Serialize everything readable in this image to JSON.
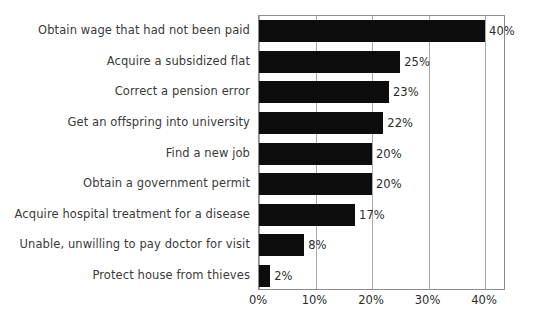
{
  "chart_data": {
    "type": "bar",
    "orientation": "horizontal",
    "title": "",
    "subtitle": "",
    "xlabel": "",
    "ylabel": "",
    "xlim": [
      0,
      43.7
    ],
    "grid": true,
    "legend": null,
    "categories": [
      "Obtain wage that had not been paid",
      "Acquire a subsidized flat",
      "Correct a pension error",
      "Get an offspring into university",
      "Find a new job",
      "Obtain a government permit",
      "Acquire hospital treatment for a disease",
      "Unable, unwilling to pay doctor for visit",
      "Protect house from thieves"
    ],
    "values": [
      40,
      25,
      23,
      22,
      20,
      20,
      17,
      8,
      2
    ],
    "value_labels": [
      "40%",
      "25%",
      "23%",
      "22%",
      "20%",
      "20%",
      "17%",
      "8%",
      "2%"
    ],
    "xticks": [
      0,
      10,
      20,
      30,
      40
    ],
    "xtick_labels": [
      "0%",
      "10%",
      "20%",
      "30%",
      "40%"
    ],
    "bar_color": "#0d0d0d",
    "grid_color": "#a8a8a8",
    "border_color": "#8c8c8c",
    "background_color": "#ffffff",
    "text_color": "#2b2b2b"
  }
}
